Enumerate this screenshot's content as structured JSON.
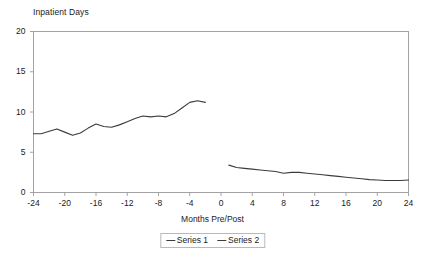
{
  "chart_data": {
    "type": "line",
    "title": "Inpatient Days",
    "xlabel": "Months Pre/Post",
    "ylabel": "Inpatient Days",
    "xlim": [
      -24,
      24
    ],
    "ylim": [
      0,
      20
    ],
    "grid": false,
    "legend_position": "bottom",
    "xticks": [
      "-24",
      "-20",
      "-16",
      "-12",
      "-8",
      "-4",
      "0",
      "4",
      "8",
      "12",
      "16",
      "20",
      "24"
    ],
    "xtick_values": [
      -24,
      -20,
      -16,
      -12,
      -8,
      -4,
      0,
      4,
      8,
      12,
      16,
      20,
      24
    ],
    "yticks": [
      "0",
      "5",
      "10",
      "15",
      "20"
    ],
    "ytick_values": [
      0,
      5,
      10,
      15,
      20
    ],
    "line_color": "#3b3b3b",
    "axis_color": "#9a9a9a",
    "series": [
      {
        "name": "Series 1",
        "x": [
          -24,
          -23,
          -22,
          -21,
          -20,
          -19,
          -18,
          -17,
          -16,
          -15,
          -14,
          -13,
          -12,
          -11,
          -10,
          -9,
          -8,
          -7,
          -6,
          -5,
          -4,
          -3,
          -2
        ],
        "values": [
          7.3,
          7.3,
          7.6,
          7.9,
          7.5,
          7.1,
          7.4,
          8.0,
          8.5,
          8.2,
          8.1,
          8.4,
          8.8,
          9.2,
          9.5,
          9.4,
          9.5,
          9.4,
          9.8,
          10.5,
          11.2,
          11.4,
          11.2
        ]
      },
      {
        "name": "Series 2",
        "x": [
          1,
          2,
          3,
          4,
          5,
          6,
          7,
          8,
          9,
          10,
          11,
          12,
          13,
          14,
          15,
          16,
          17,
          18,
          19,
          20,
          21,
          22,
          23,
          24
        ],
        "values": [
          3.4,
          3.1,
          3.0,
          2.9,
          2.8,
          2.7,
          2.6,
          2.4,
          2.5,
          2.5,
          2.4,
          2.3,
          2.2,
          2.1,
          2.0,
          1.9,
          1.8,
          1.7,
          1.6,
          1.55,
          1.5,
          1.5,
          1.5,
          1.55
        ]
      }
    ],
    "legend": [
      {
        "label": "Series 1"
      },
      {
        "label": "Series 2"
      }
    ]
  }
}
